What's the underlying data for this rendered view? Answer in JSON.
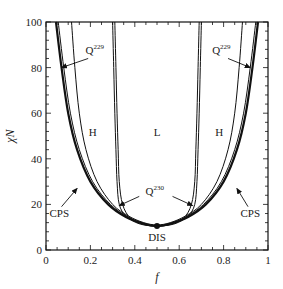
{
  "chart_data": {
    "type": "line",
    "title": "",
    "xlabel": "f",
    "ylabel": "χN",
    "xlim": [
      0,
      1
    ],
    "ylim": [
      0,
      100
    ],
    "x_ticks": [
      0,
      0.2,
      0.4,
      0.6,
      0.8,
      1
    ],
    "x_tick_labels": [
      "0",
      "0.2",
      "0.4",
      "0.6",
      "0.8",
      "1"
    ],
    "y_ticks": [
      0,
      20,
      40,
      60,
      80,
      100
    ],
    "y_tick_labels": [
      "0",
      "20",
      "40",
      "60",
      "80",
      "100"
    ],
    "grid": false,
    "legend": null,
    "series": [
      {
        "name": "CPS (outer, thick)",
        "width": 2.2,
        "points": [
          [
            0.045,
            100
          ],
          [
            0.07,
            80
          ],
          [
            0.1,
            60
          ],
          [
            0.14,
            44
          ],
          [
            0.2,
            30
          ],
          [
            0.28,
            20
          ],
          [
            0.36,
            14.5
          ],
          [
            0.44,
            11.5
          ],
          [
            0.5,
            10.5
          ],
          [
            0.56,
            11.5
          ],
          [
            0.64,
            14.5
          ],
          [
            0.72,
            20
          ],
          [
            0.8,
            30
          ],
          [
            0.86,
            44
          ],
          [
            0.9,
            60
          ],
          [
            0.93,
            80
          ],
          [
            0.955,
            100
          ]
        ]
      },
      {
        "name": "CPS (outer, thin)",
        "width": 1.0,
        "points": [
          [
            0.055,
            100
          ],
          [
            0.08,
            80
          ],
          [
            0.11,
            60
          ],
          [
            0.15,
            44
          ],
          [
            0.21,
            30
          ],
          [
            0.29,
            20
          ],
          [
            0.37,
            14.5
          ],
          [
            0.44,
            11.7
          ],
          [
            0.5,
            10.7
          ],
          [
            0.56,
            11.7
          ],
          [
            0.63,
            14.5
          ],
          [
            0.71,
            20
          ],
          [
            0.79,
            30
          ],
          [
            0.85,
            44
          ],
          [
            0.89,
            60
          ],
          [
            0.92,
            80
          ],
          [
            0.945,
            100
          ]
        ]
      },
      {
        "name": "Q229 boundary",
        "width": 1.0,
        "points": [
          [
            0.115,
            100
          ],
          [
            0.13,
            80
          ],
          [
            0.15,
            60
          ],
          [
            0.18,
            44
          ],
          [
            0.23,
            30
          ],
          [
            0.3,
            20
          ],
          [
            0.37,
            15
          ],
          [
            0.44,
            12
          ],
          [
            0.5,
            11
          ],
          [
            0.56,
            12
          ],
          [
            0.63,
            15
          ],
          [
            0.7,
            20
          ],
          [
            0.77,
            30
          ],
          [
            0.82,
            44
          ],
          [
            0.85,
            60
          ],
          [
            0.87,
            80
          ],
          [
            0.885,
            100
          ]
        ]
      },
      {
        "name": "Q230 boundary (outer)",
        "width": 1.0,
        "points": [
          [
            0.3,
            100
          ],
          [
            0.305,
            80
          ],
          [
            0.31,
            60
          ],
          [
            0.315,
            44
          ],
          [
            0.32,
            30
          ],
          [
            0.33,
            20
          ],
          [
            0.36,
            15
          ],
          [
            0.42,
            11.5
          ],
          [
            0.5,
            10.5
          ],
          [
            0.58,
            11.5
          ],
          [
            0.64,
            15
          ],
          [
            0.67,
            20
          ],
          [
            0.68,
            30
          ],
          [
            0.685,
            44
          ],
          [
            0.69,
            60
          ],
          [
            0.695,
            80
          ],
          [
            0.7,
            100
          ]
        ]
      },
      {
        "name": "Q230 boundary (inner)",
        "width": 1.0,
        "points": [
          [
            0.31,
            100
          ],
          [
            0.315,
            80
          ],
          [
            0.32,
            60
          ],
          [
            0.325,
            44
          ],
          [
            0.33,
            30
          ],
          [
            0.345,
            20
          ],
          [
            0.38,
            14
          ],
          [
            0.44,
            11.2
          ],
          [
            0.5,
            10.5
          ],
          [
            0.56,
            11.2
          ],
          [
            0.62,
            14
          ],
          [
            0.655,
            20
          ],
          [
            0.67,
            30
          ],
          [
            0.675,
            44
          ],
          [
            0.68,
            60
          ],
          [
            0.685,
            80
          ],
          [
            0.69,
            100
          ]
        ]
      }
    ],
    "annotations": [
      {
        "text": "H",
        "x": 0.21,
        "y": 50,
        "arrow": false
      },
      {
        "text": "L",
        "x": 0.5,
        "y": 50,
        "arrow": false
      },
      {
        "text": "H",
        "x": 0.78,
        "y": 50,
        "arrow": false
      },
      {
        "text": "Q",
        "sup": "229",
        "x": 0.22,
        "y": 86,
        "arrow_to": [
          0.07,
          80
        ]
      },
      {
        "text": "Q",
        "sup": "229",
        "x": 0.79,
        "y": 86,
        "arrow_to": [
          0.92,
          80
        ]
      },
      {
        "text": "Q",
        "sup": "230",
        "x": 0.49,
        "y": 24,
        "arrow_from_left": [
          0.42,
          23.5
        ],
        "arrow_to_left": [
          0.33,
          19.5
        ],
        "arrow_from_right": [
          0.57,
          23.5
        ],
        "arrow_to_right": [
          0.66,
          19.5
        ]
      },
      {
        "text": "CPS",
        "x": 0.06,
        "y": 14.5,
        "arrow_to": [
          0.14,
          27
        ]
      },
      {
        "text": "CPS",
        "x": 0.92,
        "y": 14.5,
        "arrow_to": [
          0.86,
          27
        ]
      },
      {
        "text": "DIS",
        "x": 0.5,
        "y": 4,
        "point": [
          0.5,
          10.5
        ]
      }
    ]
  }
}
